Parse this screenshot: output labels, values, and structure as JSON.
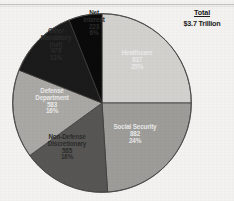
{
  "summary": {
    "total_label": "Total",
    "total_value": "$3.7 Trillion"
  },
  "chart_data": {
    "type": "pie",
    "title": "",
    "subtitle": "",
    "xlabel": "",
    "ylabel": "",
    "total_label": "Total",
    "total_value": "$3.7 Trillion",
    "units": "billions of dollars",
    "legend_position": "none",
    "labels_inside_slices": true,
    "start_angle_deg": 0,
    "direction": "clockwise",
    "categories": [
      "Healthcare",
      "Social Security",
      "Non-Defense Discretionary",
      "Defense Department",
      "Other Mandatory (net)",
      "Net Interest"
    ],
    "values": [
      937,
      882,
      585,
      583,
      479,
      223
    ],
    "percents": [
      25,
      24,
      16,
      16,
      13,
      6
    ],
    "colors": [
      "#d2d1cd",
      "#9d9c98",
      "#575654",
      "#a9a8a4",
      "#1b1b1b",
      "#0a0a0a"
    ],
    "slices": [
      {
        "name": "Healthcare",
        "label_lines": [
          "Healthcare",
          "937",
          "25%"
        ],
        "value": 937,
        "percent": 25,
        "percent_text": "25%",
        "value_text": "937",
        "color": "#d2d1cd",
        "label_color": "dark",
        "start_deg": 0,
        "end_deg": 90
      },
      {
        "name": "Social Security",
        "label_lines": [
          "Social Security",
          "882",
          "24%"
        ],
        "value": 882,
        "percent": 24,
        "percent_text": "24%",
        "value_text": "882",
        "color": "#9d9c98",
        "label_color": "dark",
        "start_deg": 90,
        "end_deg": 176.4
      },
      {
        "name": "Non-Defense Discretionary",
        "label_lines": [
          "Non-Defense",
          "Discretionary",
          "585",
          "16%"
        ],
        "value": 585,
        "percent": 16,
        "percent_text": "16%",
        "value_text": "585",
        "color": "#575654",
        "label_color": "light",
        "start_deg": 176.4,
        "end_deg": 234
      },
      {
        "name": "Defense Department",
        "label_lines": [
          "Defense",
          "Department",
          "583",
          "16%"
        ],
        "value": 583,
        "percent": 16,
        "percent_text": "16%",
        "value_text": "583",
        "color": "#a9a8a4",
        "label_color": "dark",
        "start_deg": 234,
        "end_deg": 291.6
      },
      {
        "name": "Other Mandatory (net)",
        "label_lines": [
          "Other",
          "Mandatory",
          "(net)",
          "479",
          "13%"
        ],
        "value": 479,
        "percent": 13,
        "percent_text": "13%",
        "value_text": "479",
        "color": "#1b1b1b",
        "label_color": "light",
        "start_deg": 291.6,
        "end_deg": 338.4
      },
      {
        "name": "Net Interest",
        "label_lines": [
          "Net",
          "Interest",
          "223",
          "6%"
        ],
        "value": 223,
        "percent": 6,
        "percent_text": "6%",
        "value_text": "223",
        "color": "#0a0a0a",
        "label_color": "light",
        "start_deg": 338.4,
        "end_deg": 360
      }
    ]
  },
  "labels": {
    "healthcare": {
      "l0": "Healthcare",
      "l1": "937",
      "l2": "25%"
    },
    "social_security": {
      "l0": "Social Security",
      "l1": "882",
      "l2": "24%"
    },
    "non_defense": {
      "l0": "Non-Defense",
      "l1": "Discretionary",
      "l2": "585",
      "l3": "16%"
    },
    "defense": {
      "l0": "Defense",
      "l1": "Department",
      "l2": "583",
      "l3": "16%"
    },
    "other_mandatory": {
      "l0": "Other",
      "l1": "Mandatory",
      "l2": "(net)",
      "l3": "479",
      "l4": "13%"
    },
    "net_interest": {
      "l0": "Net",
      "l1": "Interest",
      "l2": "223",
      "l3": "6%"
    }
  }
}
